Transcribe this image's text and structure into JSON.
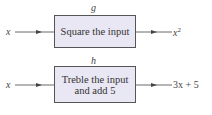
{
  "machines": [
    {
      "name": "g",
      "input": "x",
      "operation": "Square the input",
      "output": "x",
      "output_exponent": "2"
    },
    {
      "name": "h",
      "input": "x",
      "operation_line1": "Treble the input",
      "operation_line2": "and add 5",
      "output": "3x + 5"
    }
  ]
}
